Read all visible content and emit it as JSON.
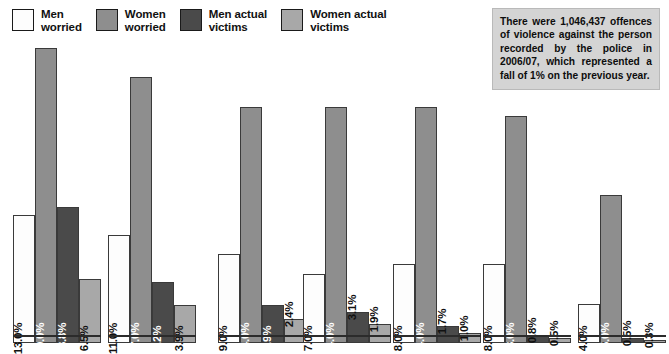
{
  "legend": {
    "items": [
      {
        "label": "Men\nworried",
        "color": "#fdfdfd",
        "series_key": "men_worried",
        "swatch_name": "legend-swatch-men-worried"
      },
      {
        "label": "Women\nworried",
        "color": "#8e8e8e",
        "series_key": "women_worried",
        "swatch_name": "legend-swatch-women-worried"
      },
      {
        "label": "Men actual\nvictims",
        "color": "#4a4a4a",
        "series_key": "men_victims",
        "swatch_name": "legend-swatch-men-victims"
      },
      {
        "label": "Women actual\nvictims",
        "color": "#a8a8a8",
        "series_key": "women_victims",
        "swatch_name": "legend-swatch-women-victims"
      }
    ]
  },
  "note": {
    "text": "There were 1,046,437 offences of violence against the person recorded by the police in 2006/07, which represented a fall of 1% on the previous year.",
    "background": "#d4d4d4"
  },
  "chart_data": {
    "type": "bar",
    "title": "",
    "xlabel": "",
    "ylabel": "",
    "ylim": [
      0,
      30
    ],
    "grid": false,
    "legend_position": "top-left",
    "categories": [
      "1",
      "2",
      "3",
      "4",
      "5",
      "6",
      "7"
    ],
    "series": [
      {
        "name": "Men worried",
        "key": "men_worried",
        "color": "#fdfdfd",
        "values": [
          13.0,
          11.0,
          9.0,
          7.0,
          8.0,
          8.0,
          4.0
        ]
      },
      {
        "name": "Women worried",
        "key": "women_worried",
        "color": "#8e8e8e",
        "values": [
          30.0,
          27.0,
          24.0,
          24.0,
          24.0,
          23.0,
          15.0
        ]
      },
      {
        "name": "Men actual victims",
        "key": "men_victims",
        "color": "#4a4a4a",
        "values": [
          13.8,
          6.2,
          3.9,
          3.1,
          1.7,
          0.8,
          0.5
        ]
      },
      {
        "name": "Women actual victims",
        "key": "women_victims",
        "color": "#a8a8a8",
        "values": [
          6.5,
          3.9,
          2.4,
          1.9,
          1.0,
          0.5,
          0.3
        ]
      }
    ],
    "data_labels": [
      [
        "13.0%",
        "30.0%",
        "13.8%",
        "6.5%"
      ],
      [
        "11.0%",
        "27.0%",
        "6.2%",
        "3.9%"
      ],
      [
        "9.0%",
        "24.0%",
        "3.9%",
        "2.4%"
      ],
      [
        "7.0%",
        "24.0%",
        "3.1%",
        "1.9%"
      ],
      [
        "8.0%",
        "24.0%",
        "1.7%",
        "1.0%"
      ],
      [
        "8.0%",
        "23.0%",
        "0.8%",
        "0.5%"
      ],
      [
        "4.0%",
        "15.0%",
        "0.5%",
        "0.3%"
      ]
    ]
  }
}
